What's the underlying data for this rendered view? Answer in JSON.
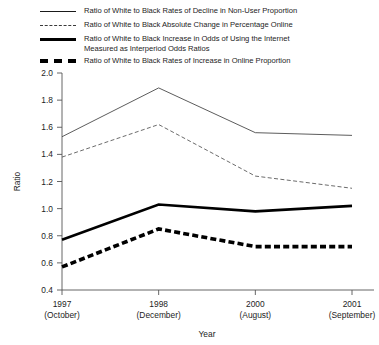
{
  "chart_data": {
    "type": "line",
    "title": "",
    "xlabel": "Year",
    "ylabel": "Ratio",
    "grid": false,
    "legend_position": "top",
    "ylim": [
      0.4,
      2.0
    ],
    "ytick_labels": [
      "2.0",
      "1.8",
      "1.6",
      "1.4",
      "1.2",
      "1.0",
      "0.8",
      "0.6",
      "0.4"
    ],
    "yticks": [
      2.0,
      1.8,
      1.6,
      1.4,
      1.2,
      1.0,
      0.8,
      0.6,
      0.4
    ],
    "categories": [
      "1997",
      "1998",
      "2000",
      "2001"
    ],
    "category_sublabels": [
      "(October)",
      "(December)",
      "(August)",
      "(September)"
    ],
    "x": [
      "1997 (October)",
      "1998 (December)",
      "2000 (August)",
      "2001 (September)"
    ],
    "series": [
      {
        "name": "Ratio of White to Black Rates of Decline in Non-User Proportion",
        "style": "thin-solid",
        "values": [
          1.53,
          1.89,
          1.56,
          1.54
        ]
      },
      {
        "name": "Ratio of White to Black Absolute Change in Percentage Online",
        "style": "thin-dashed",
        "values": [
          1.38,
          1.62,
          1.24,
          1.15
        ]
      },
      {
        "name": "Ratio of White to Black Increase in Odds of Using the Internet\nMeasured as Interperiod Odds Ratios",
        "style": "thick-solid",
        "values": [
          0.77,
          1.03,
          0.98,
          1.02
        ]
      },
      {
        "name": "Ratio of White to Black Rates of Increase in Online Proportion",
        "style": "thick-dashed",
        "values": [
          0.57,
          0.85,
          0.72,
          0.72
        ]
      }
    ]
  },
  "legend": {
    "items": [
      {
        "swatch": "thin-solid-line-swatch",
        "label": "Ratio of White to Black Rates of Decline in Non-User Proportion"
      },
      {
        "swatch": "thin-dashed-line-swatch",
        "label": "Ratio of White to Black Absolute Change in Percentage Online"
      },
      {
        "swatch": "thick-solid-line-swatch",
        "label": "Ratio of White to Black Increase in Odds of Using the Internet\nMeasured as Interperiod Odds Ratios"
      },
      {
        "swatch": "thick-dashed-line-swatch",
        "label": "Ratio of White to Black Rates of Increase in Online Proportion"
      }
    ]
  },
  "axes": {
    "y_title": "Ratio",
    "x_title": "Year"
  }
}
